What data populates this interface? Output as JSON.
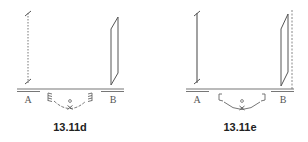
{
  "figures": [
    {
      "id": "d",
      "caption": "13.11d",
      "label_a": "A",
      "label_b": "B",
      "left_element": "dotted vertical line",
      "right_element": "tilted parallelogram (plane)",
      "bottom_element": "springs with arc and center marker"
    },
    {
      "id": "e",
      "caption": "13.11e",
      "label_a": "A",
      "label_b": "B",
      "left_element": "solid vertical line",
      "right_element": "tilted parallelogram with dashed reference line",
      "bottom_element": "brackets with arc and center marker"
    }
  ],
  "colors": {
    "line": "#555555",
    "light_line": "#999999",
    "text": "#222222"
  }
}
